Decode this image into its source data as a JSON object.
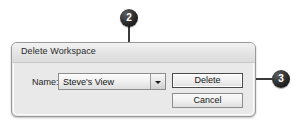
{
  "dialog": {
    "title": "Delete Workspace",
    "name_label": "Name:",
    "combo": {
      "value": "Steve's View",
      "arrow_icon": "chevron-down-icon"
    },
    "buttons": {
      "delete": "Delete",
      "cancel": "Cancel"
    }
  },
  "callouts": [
    {
      "number": "2"
    },
    {
      "number": "3"
    }
  ],
  "colors": {
    "page_background": "#ffffff",
    "dialog_background": "#e9e9e9",
    "dialog_border": "#9a9a9a",
    "titlebar_top": "#f2f2f2",
    "titlebar_bottom": "#dcdcdc",
    "text": "#1e1e1e",
    "callout_fill": "#1a1a1a",
    "callout_text": "#ffffff",
    "leader_line": "#3a3a3a",
    "focus_button_border": "#4a4a4a"
  }
}
